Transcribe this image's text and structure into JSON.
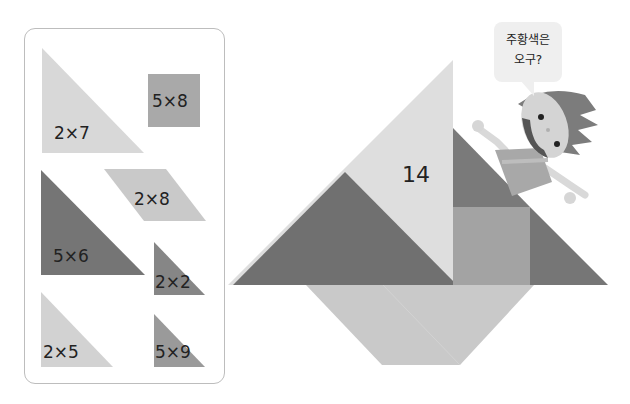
{
  "pieces_panel": {
    "pieces": [
      {
        "id": "piece-2x7",
        "shape": "triangle",
        "label": "2×7",
        "color": "#d8d8d8"
      },
      {
        "id": "piece-5x8",
        "shape": "square",
        "label": "5×8",
        "color": "#a9a9a9"
      },
      {
        "id": "piece-2x8",
        "shape": "parallelogram",
        "label": "2×8",
        "color": "#c9c9c9"
      },
      {
        "id": "piece-5x6",
        "shape": "triangle",
        "label": "5×6",
        "color": "#757575"
      },
      {
        "id": "piece-2x2",
        "shape": "triangle",
        "label": "2×2",
        "color": "#868686"
      },
      {
        "id": "piece-2x5",
        "shape": "triangle",
        "label": "2×5",
        "color": "#d2d2d2"
      },
      {
        "id": "piece-5x9",
        "shape": "triangle",
        "label": "5×9",
        "color": "#9a9a9a"
      }
    ]
  },
  "tangram_boat": {
    "sail_large_label": "14",
    "colors": {
      "sail_light": "#dedede",
      "sail_dark": "#707070",
      "right_small_triangle": "#7a7a7a",
      "square": "#a3a3a3",
      "right_triangle": "#767676",
      "hull": "#c9c9c9"
    }
  },
  "character": {
    "speech_line1": "주황색은",
    "speech_line2": "오구?"
  }
}
